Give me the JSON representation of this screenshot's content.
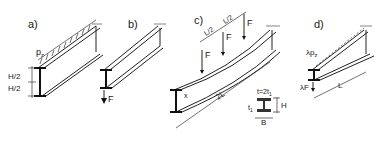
{
  "panels": [
    {
      "id": "a",
      "label": "a)",
      "load_label": "p",
      "load_sub": "z",
      "dim_top": "H/2",
      "dim_bottom": "H/2"
    },
    {
      "id": "b",
      "label": "b)",
      "force_label": "F"
    },
    {
      "id": "c",
      "label": "c)",
      "spacing_1": "L/2",
      "spacing_2": "L/2",
      "forces": [
        "F",
        "F",
        "F"
      ],
      "span_label": "2L",
      "x_label": "x",
      "section": {
        "web": "t=2t",
        "web_sub": "1",
        "flange": "t",
        "flange_sub": "1",
        "height": "H",
        "width": "B"
      }
    },
    {
      "id": "d",
      "label": "d)",
      "load_label": "λp",
      "load_sub": "z",
      "force_label": "λF",
      "span_label": "L"
    }
  ]
}
